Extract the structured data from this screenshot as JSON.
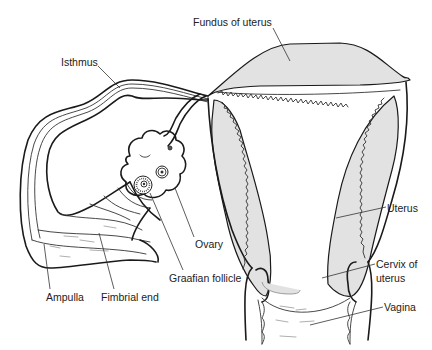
{
  "diagram": {
    "type": "anatomical-illustration",
    "fill_color": "#e2e2e2",
    "line_color": "#1a1a1a",
    "labels": {
      "fundus": "Fundus of uterus",
      "isthmus": "Isthmus",
      "ovary": "Ovary",
      "uterus": "Uterus",
      "cervix_line1": "Cervix of",
      "cervix_line2": "uterus",
      "graafian": "Graafian follicle",
      "vagina": "Vagina",
      "ampulla": "Ampulla",
      "fimbrial": "Fimbrial end"
    }
  }
}
